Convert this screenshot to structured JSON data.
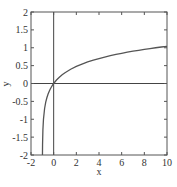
{
  "chart_data": {
    "type": "line",
    "title": "",
    "xlabel": "x",
    "ylabel": "y",
    "xlim": [
      -2,
      10
    ],
    "ylim": [
      -2,
      2
    ],
    "xticks": [
      -2,
      0,
      2,
      4,
      6,
      8,
      10
    ],
    "yticks": [
      -2,
      -1.5,
      -1,
      -0.5,
      0,
      0.5,
      1,
      1.5,
      2
    ],
    "xtick_labels": [
      "-2",
      "0",
      "2",
      "4",
      "6",
      "8",
      "10"
    ],
    "ytick_labels": [
      "-2",
      "-1.5",
      "-1",
      "-0.5",
      "0",
      "0.5",
      "1",
      "1.5",
      "2"
    ],
    "grid": false,
    "legend": null,
    "reference_lines": [
      {
        "orientation": "horizontal",
        "value": 0
      },
      {
        "orientation": "vertical",
        "value": 0
      }
    ],
    "series": [
      {
        "name": "y = log10(x+1)",
        "x": [
          -0.99,
          -0.98,
          -0.95,
          -0.9,
          -0.8,
          -0.7,
          -0.6,
          -0.5,
          -0.4,
          -0.3,
          -0.2,
          -0.1,
          0,
          0.25,
          0.5,
          0.75,
          1,
          1.5,
          2,
          2.5,
          3,
          3.5,
          4,
          4.5,
          5,
          5.5,
          6,
          6.5,
          7,
          7.5,
          8,
          8.5,
          9,
          9.5,
          10
        ],
        "y": [
          -2.0,
          -1.699,
          -1.301,
          -1.0,
          -0.699,
          -0.523,
          -0.398,
          -0.301,
          -0.222,
          -0.155,
          -0.097,
          -0.046,
          0.0,
          0.097,
          0.176,
          0.243,
          0.301,
          0.398,
          0.477,
          0.544,
          0.602,
          0.653,
          0.699,
          0.74,
          0.778,
          0.813,
          0.845,
          0.875,
          0.903,
          0.929,
          0.954,
          0.978,
          1.0,
          1.021,
          1.041
        ]
      }
    ]
  },
  "colors": {
    "axis": "#555555",
    "curve": "#555555",
    "reference_line": "#444444",
    "text": "#333333"
  }
}
